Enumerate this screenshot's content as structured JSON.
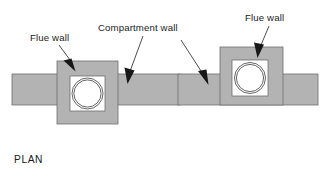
{
  "figure": {
    "view_label": "PLAN",
    "background_color": "#ffffff",
    "wall_fill_color": "#b3b3b3",
    "wall_stroke_color": "#6e6e6e",
    "aperture_fill_color": "#ffffff",
    "pipe_stroke_color": "#555555",
    "leader_color": "#3a3a3a",
    "text_color": "#1a1a1a"
  },
  "labels": {
    "flue_wall_left": "Flue wall",
    "compartment_wall": "Compartment wall",
    "flue_wall_right": "Flue wall"
  },
  "assemblies": [
    {
      "id": "left-assembly",
      "name": "centred-flue-wall-junction",
      "compartment_wall": {
        "x": 12,
        "y": 74,
        "width": 168,
        "height": 31
      },
      "flue_wall_block": {
        "x": 57,
        "y": 61,
        "width": 61,
        "height": 63
      },
      "aperture": {
        "x": 70,
        "y": 76,
        "width": 35,
        "height": 35
      },
      "flue_pipe": {
        "cx": 87.5,
        "cy": 93.5,
        "r_outer": 15.5,
        "r_inner": 13.8
      },
      "alignment": "centred"
    },
    {
      "id": "right-assembly",
      "name": "offset-flue-wall-junction",
      "compartment_wall": {
        "x": 178,
        "y": 74,
        "width": 140,
        "height": 31
      },
      "flue_wall_block": {
        "x": 220,
        "y": 47,
        "width": 63,
        "height": 58
      },
      "aperture": {
        "x": 232,
        "y": 60,
        "width": 36,
        "height": 36
      },
      "flue_pipe": {
        "cx": 250,
        "cy": 78,
        "r_outer": 15.5,
        "r_inner": 13.8
      },
      "alignment": "bottom-flush"
    }
  ],
  "leaders": [
    {
      "id": "leader-flue-wall-left",
      "label_key": "flue_wall_left",
      "label_x": 30,
      "label_y": 41,
      "line": {
        "x1": 59,
        "y1": 45,
        "x2": 72,
        "y2": 61
      },
      "arrow_tip": {
        "x": 75,
        "y": 70
      },
      "direction": "down-right"
    },
    {
      "id": "leader-compartment-wall",
      "label_key": "compartment_wall",
      "label_x": 98,
      "label_y": 31,
      "line": {
        "x1": 142,
        "y1": 35,
        "x2": 131,
        "y2": 66
      },
      "arrow_tip": {
        "x": 128,
        "y": 83
      },
      "direction": "down-left"
    },
    {
      "id": "leader-flue-wall-right",
      "label_key": "flue_wall_right",
      "label_x": 245,
      "label_y": 21,
      "line": {
        "x1": 268,
        "y1": 25,
        "x2": 262,
        "y2": 42
      },
      "arrow_tip": {
        "x": 258,
        "y": 57
      },
      "direction": "down-left"
    },
    {
      "id": "leader-compartment-wall-right",
      "label_key": "compartment_wall",
      "label_x": 0,
      "label_y": 0,
      "line": {
        "x1": 181,
        "y1": 40,
        "x2": 203,
        "y2": 72
      },
      "arrow_tip": {
        "x": 208,
        "y": 83
      },
      "direction": "down-right"
    }
  ]
}
